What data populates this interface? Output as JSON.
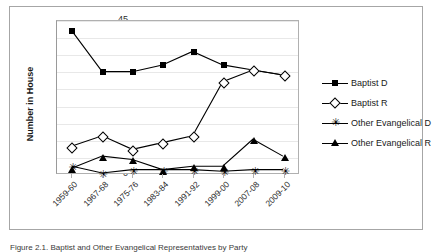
{
  "figure": {
    "caption": "Figure 2.1. Baptist and Other Evangelical Representatives by Party"
  },
  "chart_data": {
    "type": "line",
    "title": "",
    "xlabel": "",
    "ylabel": "Number in House",
    "categories": [
      "1959-60",
      "1967-68",
      "1975-76",
      "1983-84",
      "1991-92",
      "1999-00",
      "2007-08",
      "2009-10"
    ],
    "ylim": [
      0,
      45
    ],
    "ytick_step": 5,
    "yticks": [
      0,
      5,
      10,
      15,
      20,
      25,
      30,
      35,
      40,
      45
    ],
    "grid": "horizontal",
    "legend_position": "right",
    "series": [
      {
        "name": "Baptist D",
        "marker": "filled-square",
        "values": [
          42,
          30,
          30,
          32,
          36,
          32,
          30.5,
          29
        ]
      },
      {
        "name": "Baptist R",
        "marker": "open-diamond",
        "values": [
          8,
          11,
          7,
          9,
          11,
          27,
          30.5,
          29
        ]
      },
      {
        "name": "Other Evangelical D",
        "marker": "asterisk",
        "values": [
          2,
          0,
          1,
          1,
          1,
          0.5,
          1,
          1
        ]
      },
      {
        "name": "Other Evangelical R",
        "marker": "filled-triangle",
        "values": [
          1.5,
          5,
          4,
          1,
          2,
          2,
          10,
          5
        ]
      }
    ]
  },
  "colors": {
    "series_line": "#000000",
    "gridline": "#e8e8e8",
    "axis": "#b0b0b0",
    "plot_background": "#ffffff",
    "frame_border": "#a6a6a6"
  }
}
